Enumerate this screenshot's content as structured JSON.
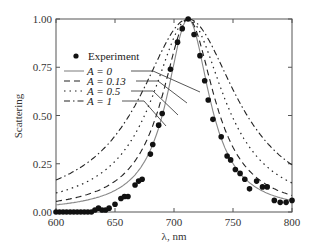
{
  "chart_data": {
    "type": "line",
    "title": "",
    "xlabel": "λ, nm",
    "ylabel": "Scattering",
    "xlim": [
      600,
      800
    ],
    "ylim": [
      0,
      1
    ],
    "xticks": [
      600,
      650,
      700,
      750,
      800
    ],
    "xtick_labels": [
      "600",
      "650",
      "700",
      "750",
      "800"
    ],
    "yticks": [
      0,
      0.25,
      0.5,
      0.75,
      1.0
    ],
    "ytick_labels": [
      "0.00",
      "0.25",
      "0.50",
      "0.75",
      "1.00"
    ],
    "grid": false,
    "legend_position": "upper left, inside",
    "peak_wavelength": 712,
    "series": [
      {
        "name": "Experiment",
        "style": "scatter-filled-circle",
        "x": [
          600,
          603,
          606,
          609,
          612,
          615,
          618,
          621,
          624,
          627,
          630,
          633,
          636,
          639,
          642,
          645,
          650,
          655,
          658,
          661,
          667,
          670,
          673,
          680,
          682,
          687,
          690,
          697,
          703,
          707,
          712,
          717,
          722,
          726,
          729,
          733,
          740,
          745,
          748,
          752,
          756,
          760,
          764,
          770,
          775,
          779,
          785,
          790,
          795,
          800
        ],
        "values": [
          0.0,
          0.0,
          0.0,
          0.0,
          0.0,
          0.0,
          0.0,
          0.0,
          0.0,
          0.0,
          0.0,
          0.01,
          0.02,
          0.01,
          0.01,
          0.02,
          0.04,
          0.07,
          0.08,
          0.08,
          0.14,
          0.16,
          0.17,
          0.3,
          0.35,
          0.45,
          0.51,
          0.74,
          0.88,
          0.95,
          1.0,
          0.92,
          0.81,
          0.68,
          0.58,
          0.48,
          0.39,
          0.29,
          0.27,
          0.22,
          0.2,
          0.17,
          0.12,
          0.16,
          0.13,
          0.13,
          0.06,
          0.05,
          0.05,
          0.06
        ]
      },
      {
        "name": "A = 0",
        "style": "solid",
        "width_nm": 22,
        "base": 0.0
      },
      {
        "name": "A = 0.13",
        "style": "dashed",
        "width_nm": 27,
        "base": 0.0
      },
      {
        "name": "A = 0.5",
        "style": "dotted",
        "width_nm": 37,
        "base": 0.0
      },
      {
        "name": "A = 1",
        "style": "dash-dot",
        "width_nm": 50,
        "base": 0.0
      }
    ],
    "curve_samples": {
      "A = 0": {
        "x": [
          600,
          650,
          680,
          700,
          712,
          725,
          750,
          800
        ],
        "values": [
          0.01,
          0.05,
          0.22,
          0.62,
          1.0,
          0.62,
          0.13,
          0.03
        ]
      },
      "A = 0.13": {
        "x": [
          600,
          650,
          680,
          700,
          712,
          725,
          750,
          800
        ],
        "values": [
          0.04,
          0.09,
          0.32,
          0.75,
          1.0,
          0.75,
          0.22,
          0.06
        ]
      },
      "A = 0.5": {
        "x": [
          600,
          650,
          680,
          700,
          712,
          725,
          750,
          800
        ],
        "values": [
          0.09,
          0.18,
          0.45,
          0.85,
          1.0,
          0.85,
          0.42,
          0.17
        ]
      },
      "A = 1": {
        "x": [
          600,
          650,
          680,
          700,
          712,
          725,
          750,
          800
        ],
        "values": [
          0.17,
          0.32,
          0.62,
          0.92,
          1.0,
          0.92,
          0.62,
          0.3
        ]
      }
    }
  },
  "legend": {
    "items": [
      {
        "label": "Experiment"
      },
      {
        "label": "A = 0"
      },
      {
        "label": "A = 0.13"
      },
      {
        "label": "A = 0.5"
      },
      {
        "label": "A = 1"
      }
    ]
  }
}
